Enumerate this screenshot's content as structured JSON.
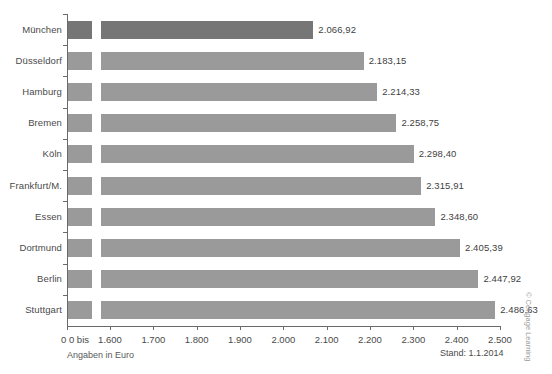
{
  "chart_data": {
    "type": "bar",
    "orientation": "horizontal",
    "title": "",
    "xlabel": "Angaben in Euro",
    "ylabel": "",
    "categories": [
      "München",
      "Düsseldorf",
      "Hamburg",
      "Bremen",
      "Köln",
      "Frankfurt/M.",
      "Essen",
      "Dortmund",
      "Berlin",
      "Stuttgart"
    ],
    "values": [
      2066.92,
      2183.15,
      2214.33,
      2258.75,
      2298.4,
      2315.91,
      2348.6,
      2405.39,
      2447.92,
      2486.63
    ],
    "value_labels": [
      "2.066,92",
      "2.183,15",
      "2.214,33",
      "2.258,75",
      "2.298,40",
      "2.315,91",
      "2.348,60",
      "2.405,39",
      "2.447,92",
      "2.486,63"
    ],
    "xlim": [
      1600,
      2500
    ],
    "axis_break": true,
    "axis_break_label": "0 bis",
    "xticks": [
      1600,
      1700,
      1800,
      1900,
      2000,
      2100,
      2200,
      2300,
      2400,
      2500
    ],
    "xtick_labels": [
      "1.600",
      "1.700",
      "1.800",
      "1.900",
      "2.000",
      "2.100",
      "2.200",
      "2.300",
      "2.400",
      "2.500"
    ],
    "origin_label": "0",
    "grid": false,
    "legend": "none",
    "highlight_index": 0,
    "colors": {
      "bar": "#9a9a9a",
      "bar_highlight": "#767676",
      "axis": "#6a6a6a",
      "text": "#4a4a4a",
      "background": "#ffffff"
    }
  },
  "footer": {
    "units_note": "Angaben in Euro",
    "as_of": "Stand: 1.1.2014",
    "credit": "© Cengage Learning"
  }
}
